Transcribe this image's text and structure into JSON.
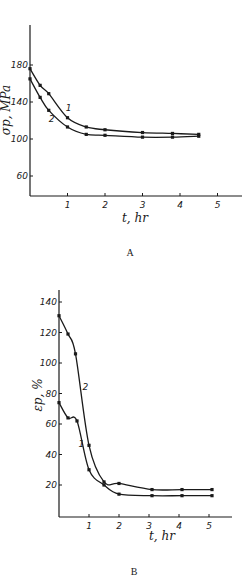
{
  "chart_data": [
    {
      "panel": "A",
      "type": "line",
      "caption": "A",
      "xlabel": "t, hr",
      "ylabel": "σp, MPa",
      "xticks": [
        "1",
        "2",
        "3",
        "4",
        "5"
      ],
      "yticks": [
        "60",
        "100",
        "140",
        "180"
      ],
      "xlim": [
        0,
        5.5
      ],
      "ylim": [
        40,
        215
      ],
      "grid": false,
      "series": [
        {
          "name": "1",
          "x": [
            0,
            0.27,
            0.5,
            1.0,
            1.5,
            2.0,
            3.0,
            3.8,
            4.5
          ],
          "values": [
            176,
            158,
            149,
            123,
            113,
            110,
            107,
            106,
            105
          ]
        },
        {
          "name": "2",
          "x": [
            0,
            0.27,
            0.5,
            1.0,
            1.5,
            2.0,
            3.0,
            3.8,
            4.5
          ],
          "values": [
            165,
            145,
            131,
            113,
            105,
            104,
            102,
            102,
            103
          ]
        }
      ]
    },
    {
      "panel": "B",
      "type": "line",
      "caption": "B",
      "xlabel": "t, hr",
      "ylabel": "εp, %",
      "xticks": [
        "1",
        "2",
        "3",
        "4",
        "5"
      ],
      "yticks": [
        "20",
        "40",
        "60",
        "80",
        "100",
        "120",
        "140"
      ],
      "xlim": [
        0,
        5.8
      ],
      "ylim": [
        0,
        150
      ],
      "grid": false,
      "series": [
        {
          "name": "1",
          "x": [
            0,
            0.3,
            0.6,
            1.0,
            1.5,
            2.0,
            3.1,
            4.1,
            5.1
          ],
          "values": [
            74,
            64,
            62,
            30,
            20,
            14,
            13,
            13,
            13
          ]
        },
        {
          "name": "2",
          "x": [
            0,
            0.3,
            0.55,
            1.0,
            1.5,
            2.0,
            3.1,
            4.1,
            5.1
          ],
          "values": [
            131,
            119,
            106,
            46,
            22,
            21,
            17,
            17,
            17
          ]
        }
      ]
    }
  ]
}
